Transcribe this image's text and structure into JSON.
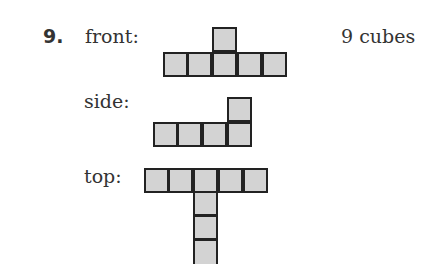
{
  "problem": {
    "number": "9.",
    "answer": "9 cubes",
    "views": {
      "front": {
        "label": "front:",
        "cells": [
          [
            0,
            1
          ],
          [
            1,
            0
          ],
          [
            2,
            0
          ],
          [
            2,
            1
          ],
          [
            3,
            0
          ],
          [
            4,
            0
          ]
        ]
      },
      "side": {
        "label": "side:",
        "cells": [
          [
            0,
            0
          ],
          [
            1,
            0
          ],
          [
            2,
            0
          ],
          [
            3,
            0
          ],
          [
            3,
            1
          ]
        ]
      },
      "top": {
        "label": "top:",
        "cells": [
          [
            0,
            0
          ],
          [
            1,
            0
          ],
          [
            2,
            0
          ],
          [
            3,
            0
          ],
          [
            4,
            0
          ],
          [
            2,
            -1
          ],
          [
            2,
            -2
          ],
          [
            2,
            -3
          ]
        ]
      }
    },
    "colors": {
      "fill": "#d3d3d3",
      "border": "#222222",
      "text": "#333333"
    }
  }
}
